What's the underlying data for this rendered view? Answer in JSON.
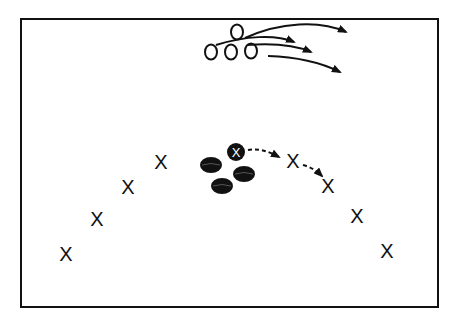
{
  "diagram": {
    "type": "play-diagram",
    "colors": {
      "ink": "#111111",
      "background": "#ffffff",
      "puck": "#111111",
      "puck_highlight": "#555555"
    },
    "rink": {
      "x": 21,
      "y": 19,
      "width": 417,
      "height": 288
    },
    "offense": {
      "symbol": "O",
      "players": [
        {
          "id": "o1",
          "x": 237,
          "y": 32
        },
        {
          "id": "o2",
          "x": 211,
          "y": 52
        },
        {
          "id": "o3",
          "x": 231,
          "y": 52
        },
        {
          "id": "o4",
          "x": 251,
          "y": 51
        }
      ]
    },
    "defense": {
      "symbol": "X",
      "players": [
        {
          "id": "x1",
          "x": 66,
          "y": 254
        },
        {
          "id": "x2",
          "x": 97,
          "y": 219
        },
        {
          "id": "x3",
          "x": 128,
          "y": 187
        },
        {
          "id": "x4",
          "x": 161,
          "y": 162
        },
        {
          "id": "x5",
          "x": 293,
          "y": 161
        },
        {
          "id": "x6",
          "x": 328,
          "y": 186
        },
        {
          "id": "x7",
          "x": 357,
          "y": 216
        },
        {
          "id": "x8",
          "x": 387,
          "y": 251
        }
      ]
    },
    "puck_carrier": {
      "symbol": "X",
      "x": 236,
      "y": 152,
      "r": 9
    },
    "pucks": [
      {
        "x": 211,
        "y": 165
      },
      {
        "x": 244,
        "y": 174
      },
      {
        "x": 222,
        "y": 186
      }
    ],
    "skate_paths": [
      {
        "d": "M245,38 C280,22 320,20 346,32"
      },
      {
        "d": "M216,45 C245,36 275,34 294,42"
      },
      {
        "d": "M247,45 C275,43 295,45 311,52"
      },
      {
        "d": "M268,56 C300,57 322,63 340,72"
      }
    ],
    "pass_paths": [
      {
        "d": "M248,150 C258,148 268,151 279,157"
      },
      {
        "d": "M303,165 C310,167 316,170 322,176"
      }
    ]
  }
}
